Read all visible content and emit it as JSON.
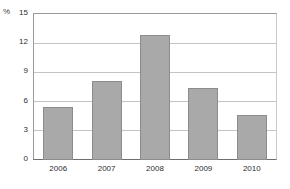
{
  "chart_data": {
    "type": "bar",
    "title": "",
    "xlabel": "",
    "ylabel": "%",
    "unit_label": "%",
    "categories": [
      "2006",
      "2007",
      "2008",
      "2009",
      "2010"
    ],
    "values": [
      5.4,
      8.1,
      12.8,
      7.4,
      4.6
    ],
    "ylim": [
      0,
      15
    ],
    "yticks": [
      0,
      3,
      6,
      9,
      12,
      15
    ],
    "ytick_labels": [
      "0",
      "3",
      "6",
      "9",
      "12",
      "15"
    ],
    "grid": true,
    "legend": false,
    "bar_color": "#a9a9a9",
    "bar_border_color": "#8c8c8c",
    "gridline_color": "#c4c4c4",
    "axis_color": "#6e6e6e",
    "background": "#ffffff"
  }
}
